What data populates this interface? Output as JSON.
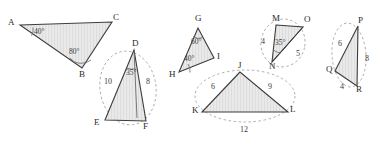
{
  "figure": {
    "background_color": "#ffffff",
    "fill_color": "#e8e8e8",
    "hatch_color": "#d2d2d2",
    "stroke_color": "#3c3c3c",
    "dash_color": "#9a9a9a",
    "text_color": "#2b2b2b"
  },
  "triangles": [
    {
      "name": "ABC",
      "vertex_labels": [
        "A",
        "C",
        "B"
      ],
      "angles": [
        "40°",
        "80°"
      ],
      "sides": [],
      "has_ellipse": false
    },
    {
      "name": "DEF",
      "vertex_labels": [
        "D",
        "E",
        "F"
      ],
      "angles": [
        "35°"
      ],
      "sides": [
        "10",
        "8"
      ],
      "has_ellipse": true
    },
    {
      "name": "GHI",
      "vertex_labels": [
        "G",
        "I",
        "H"
      ],
      "angles": [
        "60°",
        "40°"
      ],
      "sides": [],
      "has_ellipse": false
    },
    {
      "name": "JKL",
      "vertex_labels": [
        "J",
        "K",
        "L"
      ],
      "angles": [],
      "sides": [
        "6",
        "9",
        "12"
      ],
      "has_ellipse": true
    },
    {
      "name": "MNO",
      "vertex_labels": [
        "M",
        "O",
        "N"
      ],
      "angles": [
        "35°"
      ],
      "sides": [
        "4",
        "5"
      ],
      "has_ellipse": true
    },
    {
      "name": "PQR",
      "vertex_labels": [
        "P",
        "Q",
        "R"
      ],
      "angles": [],
      "sides": [
        "6",
        "8",
        "4"
      ],
      "has_ellipse": true
    }
  ],
  "labels": {
    "A": "A",
    "B": "B",
    "C": "C",
    "D": "D",
    "E": "E",
    "F": "F",
    "G": "G",
    "H": "H",
    "I": "I",
    "J": "J",
    "K": "K",
    "L": "L",
    "M": "M",
    "N": "N",
    "O": "O",
    "P": "P",
    "Q": "Q",
    "R": "R",
    "abc_angle_a": "40°",
    "abc_angle_b": "80°",
    "def_angle_d": "35°",
    "def_side_de": "10",
    "def_side_df": "8",
    "ghi_angle_g": "60°",
    "ghi_angle_h": "40°",
    "jkl_side_jk": "6",
    "jkl_side_jl": "9",
    "jkl_side_kl": "12",
    "mno_side_mn": "4",
    "mno_angle_n": "35°",
    "mno_side_no": "5",
    "pqr_side_pq": "6",
    "pqr_side_pr": "8",
    "pqr_side_qr": "4"
  }
}
